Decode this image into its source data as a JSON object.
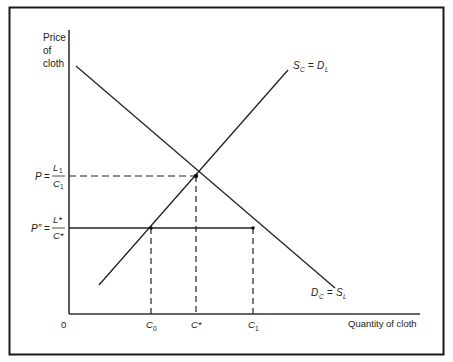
{
  "diagram": {
    "type": "supply-demand",
    "y_axis_label": [
      "Price",
      "of",
      "cloth"
    ],
    "x_axis_label": "Quantity of cloth",
    "origin_label": "0",
    "curves": {
      "supply": {
        "label_left": "S",
        "label_left_sub": "C",
        "eq": "=",
        "label_right": "D",
        "label_right_sub": "L"
      },
      "demand": {
        "label_left": "D",
        "label_left_sub": "C",
        "eq": "=",
        "label_right": "S",
        "label_right_sub": "L"
      }
    },
    "price_levels": [
      {
        "lhs": "P",
        "eq": "=",
        "num": "L",
        "num_sub": "1",
        "den": "C",
        "den_sub": "1"
      },
      {
        "lhs": "P″",
        "eq": "=",
        "num": "L*",
        "num_sub": "",
        "den": "C*",
        "den_sub": ""
      }
    ],
    "quantity_ticks": [
      {
        "base": "C",
        "sub": "0"
      },
      {
        "base": "C*",
        "sub": ""
      },
      {
        "base": "C",
        "sub": "1"
      }
    ]
  },
  "colors": {
    "line": "#222222",
    "frame": "#1a1a1a",
    "background": "#ffffff"
  }
}
